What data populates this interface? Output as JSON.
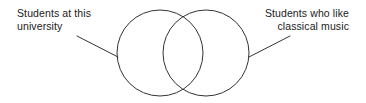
{
  "diagram": {
    "type": "venn-two-set",
    "background_color": "#ffffff",
    "stroke_color": "#333333",
    "stroke_width": 1,
    "labels": {
      "left": {
        "text": "Students at this\nuniversity",
        "align": "left"
      },
      "right": {
        "text": "Students who like\nclassical music",
        "align": "right"
      }
    },
    "sets": [
      {
        "name": "students-at-this-university",
        "cx": 160,
        "cy": 53,
        "r": 43
      },
      {
        "name": "students-who-like-classical-music",
        "cx": 206,
        "cy": 53,
        "r": 43
      }
    ],
    "leader_lines": [
      {
        "name": "leader-line-left",
        "x1": 77,
        "y1": 36,
        "x2": 118,
        "y2": 57
      },
      {
        "name": "leader-line-right",
        "x1": 249,
        "y1": 57,
        "x2": 290,
        "y2": 36
      }
    ]
  }
}
